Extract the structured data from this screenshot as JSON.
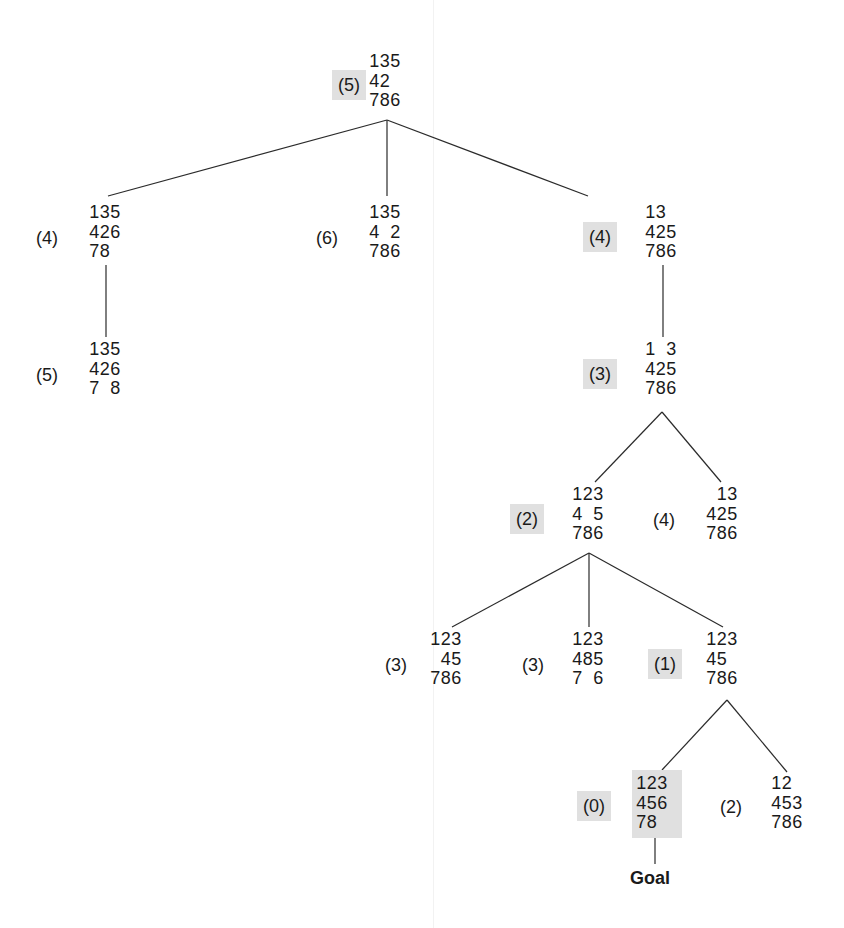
{
  "diagram": {
    "type": "search-tree",
    "colors": {
      "highlight": "#e0e0e0",
      "line": "#2b2b2b",
      "text": "#1a1a1a"
    },
    "goal_label": "Goal",
    "nodes": [
      {
        "id": "root",
        "cost": "(5)",
        "highlight": true,
        "rows": [
          "135",
          "42 ",
          "786"
        ]
      },
      {
        "id": "a",
        "cost": "(4)",
        "highlight": false,
        "rows": [
          "135",
          "426",
          "78 "
        ]
      },
      {
        "id": "b",
        "cost": "(6)",
        "highlight": false,
        "rows": [
          "135",
          "4 2",
          "786"
        ]
      },
      {
        "id": "c",
        "cost": "(4)",
        "highlight": true,
        "rows": [
          "13 ",
          "425",
          "786"
        ]
      },
      {
        "id": "a1",
        "cost": "(5)",
        "highlight": false,
        "rows": [
          "135",
          "426",
          "7 8"
        ]
      },
      {
        "id": "c1",
        "cost": "(3)",
        "highlight": true,
        "rows": [
          "1 3",
          "425",
          "786"
        ]
      },
      {
        "id": "c1a",
        "cost": "(2)",
        "highlight": true,
        "rows": [
          "123",
          "4 5",
          "786"
        ]
      },
      {
        "id": "c1b",
        "cost": "(4)",
        "highlight": false,
        "rows": [
          " 13",
          "425",
          "786"
        ]
      },
      {
        "id": "c1a1",
        "cost": "(3)",
        "highlight": false,
        "rows": [
          "123",
          " 45",
          "786"
        ]
      },
      {
        "id": "c1a2",
        "cost": "(3)",
        "highlight": false,
        "rows": [
          "123",
          "485",
          "7 6"
        ]
      },
      {
        "id": "c1a3",
        "cost": "(1)",
        "highlight": true,
        "rows": [
          "123",
          "45 ",
          "786"
        ]
      },
      {
        "id": "goal",
        "cost": "(0)",
        "highlight": true,
        "rows": [
          "123",
          "456",
          "78 "
        ]
      },
      {
        "id": "c1a3b",
        "cost": "(2)",
        "highlight": false,
        "rows": [
          "12 ",
          "453",
          "786"
        ]
      }
    ],
    "edges": [
      [
        "root",
        "a"
      ],
      [
        "root",
        "b"
      ],
      [
        "root",
        "c"
      ],
      [
        "a",
        "a1"
      ],
      [
        "c",
        "c1"
      ],
      [
        "c1",
        "c1a"
      ],
      [
        "c1",
        "c1b"
      ],
      [
        "c1a",
        "c1a1"
      ],
      [
        "c1a",
        "c1a2"
      ],
      [
        "c1a",
        "c1a3"
      ],
      [
        "c1a3",
        "goal"
      ],
      [
        "c1a3",
        "c1a3b"
      ],
      [
        "goal",
        "goal_label"
      ]
    ]
  }
}
